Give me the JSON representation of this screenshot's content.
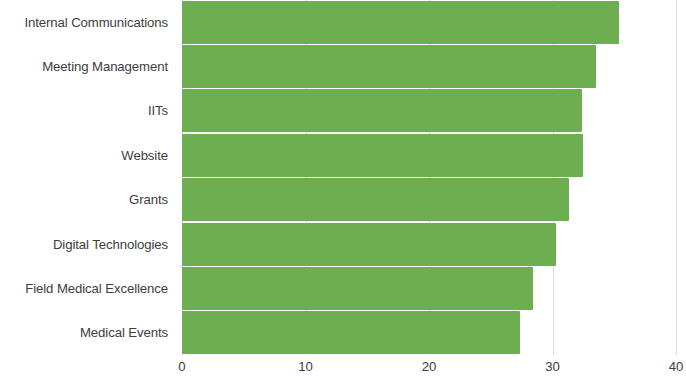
{
  "chart_data": {
    "type": "bar",
    "orientation": "horizontal",
    "title": "",
    "xlabel": "",
    "ylabel": "",
    "categories": [
      "Internal Communications",
      "Meeting Management",
      "IITs",
      "Website",
      "Grants",
      "Digital Technologies",
      "Field Medical Excellence",
      "Medical Events"
    ],
    "values": [
      35.4,
      33.5,
      32.4,
      32.5,
      31.3,
      30.3,
      28.4,
      27.4
    ],
    "xlim": [
      0,
      40
    ],
    "xticks": [
      "0",
      "10",
      "20",
      "30",
      "40"
    ],
    "xtick_values": [
      0,
      10,
      20,
      30,
      40
    ],
    "grid": true,
    "legend": false,
    "bar_color": "#6cae50",
    "label_color": "#3d3d3d",
    "gridline_color": "#dcdcdc",
    "background": "#ffffff"
  }
}
